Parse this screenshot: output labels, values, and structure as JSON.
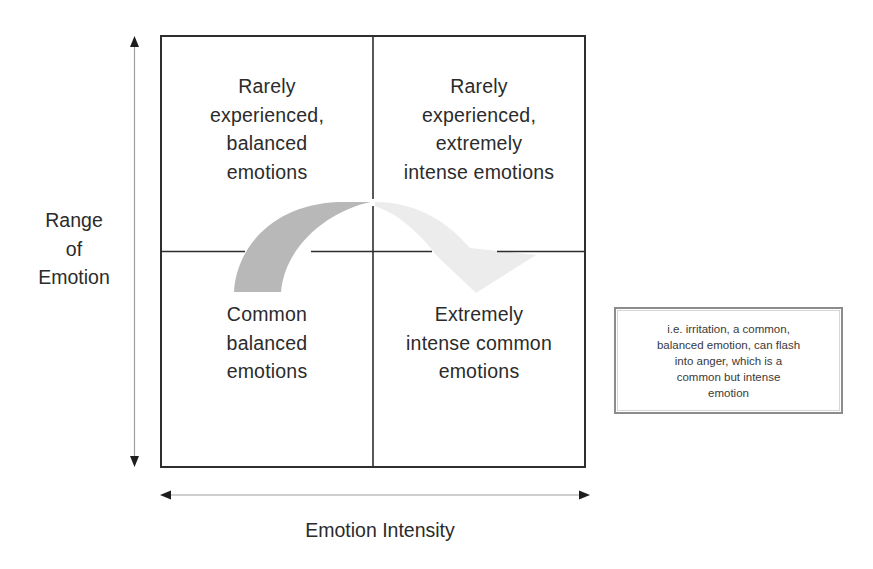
{
  "diagram": {
    "type": "2x2 quadrant matrix",
    "y_axis": {
      "label_lines": [
        "Range",
        "of",
        "Emotion"
      ],
      "direction": "bidirectional-vertical"
    },
    "x_axis": {
      "label": "Emotion Intensity",
      "direction": "bidirectional-horizontal"
    },
    "quadrants": {
      "top_left": {
        "lines": [
          "Rarely",
          "experienced,",
          "balanced",
          "emotions"
        ]
      },
      "top_right": {
        "lines": [
          "Rarely",
          "experienced,",
          "extremely",
          "intense emotions"
        ]
      },
      "bottom_left": {
        "lines": [
          "Common",
          "balanced",
          "emotions"
        ]
      },
      "bottom_right": {
        "lines": [
          "Extremely",
          "intense common",
          "emotions"
        ]
      }
    },
    "transition_arrow": {
      "from": "bottom_left",
      "to": "bottom_right",
      "start_color": "#b8b8b8",
      "end_color": "#ececec"
    },
    "note": {
      "lines": [
        "i.e. irritation, a common,",
        "balanced emotion, can flash",
        "into anger, which is a",
        "common but intense",
        "emotion"
      ]
    },
    "colors": {
      "grid_line": "#2e2e2e",
      "axis_line": "#9a9a9a",
      "arrow_head": "#1e1e1e",
      "arc_dark": "#b8b8b8",
      "arc_light": "#ececec",
      "note_border": "#8c8c8c"
    }
  }
}
